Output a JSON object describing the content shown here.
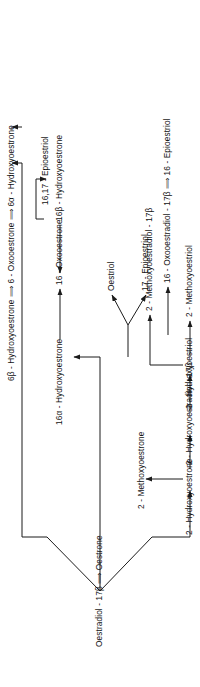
{
  "figure": {
    "type": "metabolic-pathway-diagram",
    "orientation": "rotated-90-ccw",
    "root": "Oestradiol - 17β ⟹ Oestrone"
  },
  "nodes": {
    "root": "Oestradiol - 17β ⟹ Oestrone",
    "h2_oestrone": "2 - Hydroxyoestrone",
    "m2_oestrone": "2 - Methoxyoestrone",
    "h2_oestradiol": "2 - Hydroxyoestradiol - 17β",
    "m2_oestradiol": "2 - Methoxyoestradiol - 17β",
    "h2_oestriol": "2 - Hydroxyoestriol",
    "m2_oestriol": "2 - Methoxyoestriol",
    "h16a_oestrone": "16α - Hydroxyoestrone",
    "ox16_oestrone": "16 - Oxooestrone",
    "h16b_oestrone": "16β - Hydroxyoestrone",
    "oestriol": "Oestriol",
    "epi17_oestriol": "17 - Epioestriol",
    "ox16_oestradiol": "16 - Oxooestradiol - 17β ⟹ 16 - Epioestriol",
    "epi1617_oestriol": "16,17 - Epioestriol",
    "chain_oestrone": "6β - Hydroxyoestrone ⟹ 6 - Oxooestrone ⟹ 6α - Hydroxyoestrone",
    "chain_oestradiol": "6β - Hydroxyoestradiol - 17β ⟹ 6 - Oxooestradiol - 17β ⟹ 6α - Hydroxyoestradiol"
  },
  "pathway_data": {
    "branches": [
      {
        "name": "2-hydroxylation",
        "steps": [
          "2 - Hydroxyoestrone",
          "2 - Methoxyoestrone",
          "2 - Hydroxyoestradiol - 17β",
          "2 - Methoxyoestradiol - 17β",
          "2 - Hydroxyoestriol",
          "2 - Methoxyoestriol"
        ]
      },
      {
        "name": "16-hydroxylation",
        "steps": [
          "16α - Hydroxyoestrone",
          "16 - Oxooestrone",
          "16β - Hydroxyoestrone",
          "Oestriol",
          "17 - Epioestriol",
          "16 - Oxooestradiol - 17β ⟹ 16 - Epioestriol",
          "16,17 - Epioestriol"
        ]
      },
      {
        "name": "6-hydroxylation",
        "steps": [
          "6β - Hydroxyoestrone ⟹ 6 - Oxooestrone ⟹ 6α - Hydroxyoestrone",
          "6β - Hydroxyoestradiol - 17β ⟹ 6 - Oxooestradiol - 17β ⟹ 6α - Hydroxyoestradiol"
        ]
      }
    ]
  },
  "colors": {
    "ink": "#1b1b1b",
    "background": "#ffffff"
  }
}
